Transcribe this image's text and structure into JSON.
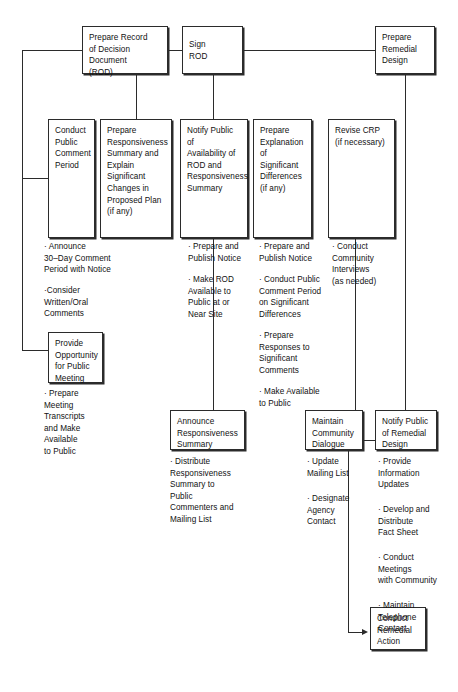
{
  "diagram": {
    "boxes": [
      {
        "id": "prepare-rod",
        "label": "Prepare Record\nof Decision\nDocument\n(ROD)"
      },
      {
        "id": "sign-rod",
        "label": "Sign\nROD"
      },
      {
        "id": "prepare-remedial-design",
        "label": "Prepare\nRemedial\nDesign"
      },
      {
        "id": "conduct-public-comment-period",
        "label": "Conduct\nPublic\nComment\nPeriod"
      },
      {
        "id": "prepare-responsiveness-summary",
        "label": "Prepare\nResponsiveness\nSummary and\nExplain\nSignificant\nChanges in\nProposed Plan\n(if any)"
      },
      {
        "id": "notify-public-availability-rod",
        "label": "Notify Public of\nAvailability of\nROD and\nResponsiveness\nSummary"
      },
      {
        "id": "prepare-explanation-significant-differences",
        "label": "Prepare\nExplanation\nof Significant\nDifferences\n(if any)"
      },
      {
        "id": "revise-crp",
        "label": "Revise CRP\n(if necessary)"
      },
      {
        "id": "provide-opportunity-public-meeting",
        "label": "Provide\nOpportunity\nfor Public\nMeeting"
      },
      {
        "id": "announce-responsiveness-summary",
        "label": "Announce\nResponsiveness\nSummary"
      },
      {
        "id": "maintain-community-dialogue",
        "label": "Maintain\nCommunity\nDialogue"
      },
      {
        "id": "notify-public-remedial-design",
        "label": "Notify Public\nof Remedial\nDesign"
      },
      {
        "id": "conduct-remedial-action",
        "label": "Conduct\nRemedial\nAction"
      }
    ],
    "notes": [
      {
        "id": "notes-public-comment-period",
        "text": "· Announce\n30–Day Comment\nPeriod with Notice"
      },
      {
        "id": "notes-consider-comments",
        "text": "·Consider\nWritten/Oral\nComments"
      },
      {
        "id": "notes-meeting-transcripts",
        "text": "· Prepare\nMeeting\nTranscripts\nand Make\nAvailable\nto Public"
      },
      {
        "id": "notes-notify-publish",
        "text": "· Prepare and\nPublish Notice"
      },
      {
        "id": "notes-make-rod-available",
        "text": "· Make ROD\nAvailable to\nPublic at or\nNear Site"
      },
      {
        "id": "notes-esd-publish",
        "text": "· Prepare and\nPublish Notice"
      },
      {
        "id": "notes-esd-comment-period",
        "text": "· Conduct Public\nComment Period\non Significant\nDifferences"
      },
      {
        "id": "notes-esd-responses",
        "text": "· Prepare\nResponses to\nSignificant\nComments"
      },
      {
        "id": "notes-esd-make-available",
        "text": "· Make Available\nto Public"
      },
      {
        "id": "notes-community-interviews",
        "text": "· Conduct\nCommunity\nInterviews\n(as needed)"
      },
      {
        "id": "notes-distribute-responsiveness",
        "text": "· Distribute\nResponsiveness\nSummary to\nPublic\nCommenters and\nMailing List"
      },
      {
        "id": "notes-update-mailing-list",
        "text": "· Update\nMailing List"
      },
      {
        "id": "notes-designate-agency-contact",
        "text": "· Designate\nAgency\nContact"
      },
      {
        "id": "notes-provide-information-updates",
        "text": "· Provide\nInformation\nUpdates"
      },
      {
        "id": "notes-develop-fact-sheet",
        "text": "· Develop and\nDistribute\nFact Sheet"
      },
      {
        "id": "notes-conduct-meetings",
        "text": "· Conduct\nMeetings\nwith Community"
      },
      {
        "id": "notes-maintain-telephone-contact",
        "text": "· Maintain\nTelephone\nContact"
      }
    ],
    "colors": {
      "line": "#2b2b2b",
      "box_border": "#2b2b2b",
      "box_fill": "#ffffff",
      "text": "#111111"
    }
  }
}
